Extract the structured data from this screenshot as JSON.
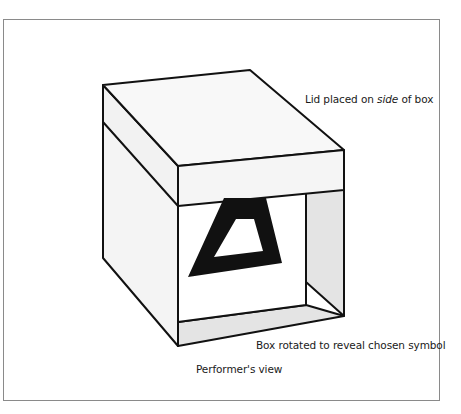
{
  "figure": {
    "labels": {
      "lid": {
        "prefix": "Lid placed on ",
        "emphasis": "side",
        "suffix": " of box"
      },
      "box": "Box rotated to reveal chosen symbol",
      "caption": "Performer's view"
    },
    "symbol": "triangle",
    "colors": {
      "outline": "#111111",
      "face_light": "#f7f7f7",
      "face_shaded": "#e6e6e6",
      "panel": "#ffffff",
      "frame_border": "#8a8a8a"
    }
  }
}
